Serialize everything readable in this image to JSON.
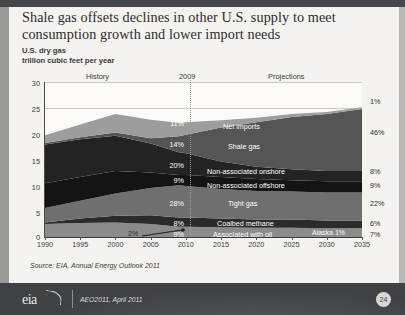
{
  "slide": {
    "title": "Shale gas offsets declines in other U.S. supply to meet consumption growth and lower import needs",
    "subtitle_1": "U.S. dry gas",
    "subtitle_2": "trillion cubic feet per year",
    "source": "Source:  EIA, Annual Energy Outlook 2011",
    "footer_note": "AEO2011, April 2011",
    "logo_text": "eia",
    "page_number": "24"
  },
  "chart_data": {
    "type": "area",
    "title": "Shale gas offsets declines in other U.S. supply to meet consumption growth and lower import needs",
    "subtitle": "U.S. dry gas",
    "ylabel": "trillion cubic feet per year",
    "xlabel": "",
    "ylim": [
      0,
      30
    ],
    "yticks": [
      0,
      5,
      10,
      15,
      20,
      25,
      30
    ],
    "ytick_labels": [
      "0",
      "5",
      "10",
      "15",
      "20",
      "25",
      "30"
    ],
    "xlim": [
      1990,
      2035
    ],
    "xticks": [
      1990,
      1995,
      2000,
      2005,
      2010,
      2015,
      2020,
      2025,
      2030,
      2035
    ],
    "xtick_labels": [
      "1990",
      "1995",
      "2000",
      "2005",
      "2010",
      "2015",
      "2020",
      "2025",
      "2030",
      "2035"
    ],
    "grid": true,
    "legend_position": "in-plot labels",
    "region_labels": {
      "history": "History",
      "divider_year": "2009",
      "projections": "Projections"
    },
    "annotations": [
      {
        "text": "2%",
        "year": 2002,
        "note": "Alaska share in 2009, leader line to 2005"
      },
      {
        "text": "Alaska  1%",
        "year": 2030,
        "note": "Alaska share in projections"
      }
    ],
    "share_column_headers": {
      "left": "2009",
      "right": "2035"
    },
    "series": [
      {
        "name": "Associated with oil",
        "label": "Associated with oil",
        "share_2009": "9%",
        "share_2035": "7%",
        "color": "#8b8b8b",
        "x": [
          1990,
          1995,
          2000,
          2005,
          2009,
          2010,
          2015,
          2020,
          2025,
          2030,
          2035
        ],
        "values": [
          2.5,
          2.7,
          2.8,
          2.5,
          2.0,
          2.0,
          1.9,
          1.8,
          1.8,
          1.7,
          1.7
        ]
      },
      {
        "name": "Coalbed methane",
        "label": "Coalbed methane",
        "share_2009": "8%",
        "share_2035": "6%",
        "color": "#2b2b2b",
        "x": [
          1990,
          1995,
          2000,
          2005,
          2009,
          2010,
          2015,
          2020,
          2025,
          2030,
          2035
        ],
        "values": [
          0.3,
          0.9,
          1.3,
          1.7,
          1.8,
          1.8,
          1.7,
          1.6,
          1.6,
          1.5,
          1.5
        ]
      },
      {
        "name": "Tight gas",
        "label": "Tight gas",
        "share_2009": "28%",
        "share_2035": "22%",
        "color": "#6f6f6f",
        "x": [
          1990,
          1995,
          2000,
          2005,
          2009,
          2010,
          2015,
          2020,
          2025,
          2030,
          2035
        ],
        "values": [
          2.8,
          3.4,
          4.3,
          5.3,
          6.2,
          6.1,
          5.7,
          5.5,
          5.4,
          5.4,
          5.4
        ]
      },
      {
        "name": "Non-associated offshore",
        "label": "Non-associated offshore",
        "share_2009": "9%",
        "share_2035": "9%",
        "color": "#141414",
        "x": [
          1990,
          1995,
          2000,
          2005,
          2009,
          2010,
          2015,
          2020,
          2025,
          2030,
          2035
        ],
        "values": [
          4.8,
          4.6,
          4.4,
          3.0,
          2.0,
          2.1,
          2.3,
          2.3,
          2.2,
          2.2,
          2.2
        ]
      },
      {
        "name": "Non-associated onshore",
        "label": "Non-associated onshore",
        "share_2009": "20%",
        "share_2035": "8%",
        "color": "#232323",
        "x": [
          1990,
          1995,
          2000,
          2005,
          2009,
          2010,
          2015,
          2020,
          2025,
          2030,
          2035
        ],
        "values": [
          7.5,
          7.3,
          6.8,
          5.6,
          4.4,
          4.2,
          3.0,
          2.4,
          2.1,
          2.0,
          2.0
        ]
      },
      {
        "name": "Shale gas",
        "label": "Shale gas",
        "share_2009": "14%",
        "share_2035": "46%",
        "color": "#555555",
        "x": [
          1990,
          1995,
          2000,
          2005,
          2009,
          2010,
          2015,
          2020,
          2025,
          2030,
          2035
        ],
        "values": [
          0.3,
          0.4,
          0.6,
          1.0,
          3.1,
          3.6,
          6.6,
          8.6,
          10.1,
          11.0,
          12.0
        ]
      },
      {
        "name": "Net imports",
        "label": "Net imports",
        "share_2009": "11%",
        "share_2035": "1%",
        "color": "#9d9d9d",
        "x": [
          1990,
          1995,
          2000,
          2005,
          2009,
          2010,
          2015,
          2020,
          2025,
          2030,
          2035
        ],
        "values": [
          1.5,
          2.5,
          3.6,
          3.6,
          2.6,
          2.4,
          1.4,
          0.9,
          0.6,
          0.4,
          0.3
        ]
      }
    ]
  }
}
